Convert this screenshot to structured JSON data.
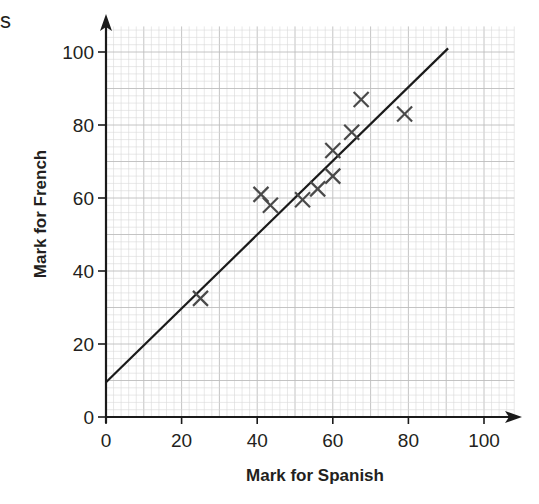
{
  "stray_text": "s",
  "chart_data": {
    "type": "scatter",
    "title": "",
    "xlabel": "Mark for Spanish",
    "ylabel": "Mark for French",
    "xlim": [
      0,
      110
    ],
    "ylim": [
      0,
      110
    ],
    "x_ticks": [
      0,
      20,
      40,
      60,
      80,
      100
    ],
    "y_ticks": [
      0,
      20,
      40,
      60,
      80,
      100
    ],
    "grid": {
      "minor_step": 2,
      "major_step": 10,
      "on": true
    },
    "marker": "x",
    "legend": null,
    "series": [
      {
        "name": "Students",
        "points": [
          {
            "x": 25,
            "y": 32.5
          },
          {
            "x": 41,
            "y": 61
          },
          {
            "x": 43.5,
            "y": 58
          },
          {
            "x": 52,
            "y": 59.5
          },
          {
            "x": 56,
            "y": 62.5
          },
          {
            "x": 60,
            "y": 66
          },
          {
            "x": 60,
            "y": 73
          },
          {
            "x": 65,
            "y": 78
          },
          {
            "x": 67.5,
            "y": 87
          },
          {
            "x": 79,
            "y": 83
          }
        ]
      }
    ],
    "line_of_best_fit": {
      "x0": 0,
      "y0": 9.5,
      "x1": 90.5,
      "y1": 101
    }
  },
  "colors": {
    "axis": "#1a1a1a",
    "grid_minor": "#d9d9d9",
    "grid_major": "#bdbdbd",
    "marker": "#4a4a4a",
    "fit_line": "#1a1a1a"
  }
}
